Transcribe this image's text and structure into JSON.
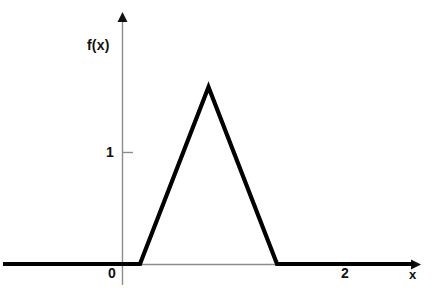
{
  "chart_data": {
    "type": "line",
    "title": "",
    "subtitle": "",
    "xlabel": "x",
    "ylabel": "f(x)",
    "x": [
      -2,
      0,
      1,
      2,
      4
    ],
    "y": [
      0,
      0,
      1,
      0,
      0
    ],
    "series": [
      {
        "name": "f(x)",
        "x": [
          -2,
          0,
          1,
          2,
          4
        ],
        "values": [
          0,
          0,
          1,
          0,
          0
        ]
      }
    ],
    "xlim": [
      -2,
      4
    ],
    "ylim": [
      0,
      1.35
    ],
    "x_ticks": [
      0,
      2
    ],
    "x_tick_labels": [
      "0",
      "2"
    ],
    "y_ticks": [
      1
    ],
    "y_tick_labels": [
      "1"
    ],
    "grid": false,
    "legend": false,
    "legend_position": "none",
    "annotations": [],
    "colors": {
      "curve": "#000000",
      "axis": "#8c8c8c",
      "text": "#111111",
      "background": "#ffffff"
    }
  },
  "axes": {
    "y_axis_label": "f(x)",
    "x_axis_label": "x",
    "y_tick_1": "1",
    "x_tick_0": "0",
    "x_tick_2": "2"
  }
}
